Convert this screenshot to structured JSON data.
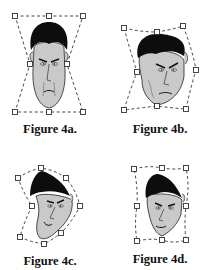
{
  "colors": {
    "hair": "#0d0d0d",
    "skin": "#c9c9c9",
    "line": "#2a2a2a",
    "cage": "#333333",
    "background": "#ffffff"
  },
  "figures": [
    {
      "id": "4a",
      "caption": "Figure 4a.",
      "description": "Original face with hourglass control lattice",
      "control_points": [
        [
          15,
          16
        ],
        [
          49,
          16
        ],
        [
          83,
          16
        ],
        [
          30,
          64
        ],
        [
          67,
          64
        ],
        [
          15,
          112
        ],
        [
          49,
          112
        ],
        [
          83,
          112
        ]
      ]
    },
    {
      "id": "4b",
      "caption": "Figure 4b.",
      "description": "Face warped with tilted lattice",
      "control_points": [
        [
          124,
          28
        ],
        [
          157,
          32
        ],
        [
          183,
          26
        ],
        [
          137,
          72
        ],
        [
          196,
          70
        ],
        [
          124,
          110
        ],
        [
          157,
          106
        ],
        [
          186,
          109
        ]
      ]
    },
    {
      "id": "4c",
      "caption": "Figure 4c.",
      "description": "Face warped into a bent crescent lattice",
      "control_points": [
        [
          18,
          178
        ],
        [
          41,
          168
        ],
        [
          66,
          178
        ],
        [
          32,
          206
        ],
        [
          80,
          206
        ],
        [
          20,
          237
        ],
        [
          44,
          244
        ],
        [
          61,
          233
        ]
      ]
    },
    {
      "id": "4d",
      "caption": "Figure 4d.",
      "description": "Face warped with near-rectangular lattice",
      "control_points": [
        [
          134,
          169
        ],
        [
          162,
          168
        ],
        [
          186,
          168
        ],
        [
          137,
          206
        ],
        [
          186,
          206
        ],
        [
          137,
          241
        ],
        [
          162,
          240
        ],
        [
          186,
          240
        ]
      ]
    }
  ]
}
